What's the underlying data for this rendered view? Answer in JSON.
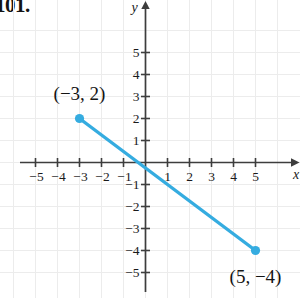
{
  "problem": {
    "number": "101."
  },
  "chart_data": {
    "type": "line",
    "title": "",
    "xlabel": "x",
    "ylabel": "y",
    "xlim": [
      -6.5,
      6.9
    ],
    "ylim": [
      -5.9,
      6.1
    ],
    "grid": true,
    "grid_color": "#ececec",
    "axis_color": "#3d3d3d",
    "series": [
      {
        "name": "segment",
        "color": "#35ace0",
        "style": "solid-with-endpoints",
        "points": [
          {
            "x": -3,
            "y": 2,
            "label": "(−3, 2)"
          },
          {
            "x": 5,
            "y": -4,
            "label": "(5, −4)"
          }
        ]
      }
    ],
    "x_ticks": [
      -5,
      -4,
      -3,
      -2,
      -1,
      1,
      2,
      3,
      4,
      5
    ],
    "x_tick_labels": [
      "−5",
      "−4",
      "−3",
      "−2",
      "−1",
      "1",
      "2",
      "3",
      "4",
      "5"
    ],
    "y_ticks": [
      5,
      4,
      3,
      2,
      1,
      -1,
      -2,
      -3,
      -4,
      -5
    ],
    "y_tick_labels": [
      "5",
      "4",
      "3",
      "2",
      "1",
      "−1",
      "−2",
      "−3",
      "−4",
      "−5"
    ],
    "annotations": [
      {
        "text": "(−3, 2)",
        "x": -3,
        "y": 3.1
      },
      {
        "text": "(5, −4)",
        "x": 5,
        "y": -5.2
      }
    ]
  }
}
